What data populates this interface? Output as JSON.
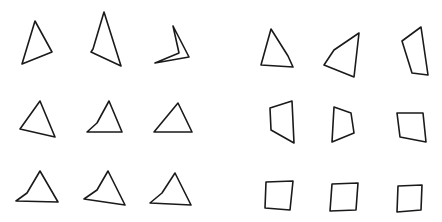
{
  "figure": {
    "stroke_color": "#1a1a1a",
    "background": "#ffffff",
    "panels": [
      {
        "name": "triangles",
        "rows": [
          [
            {
              "points": "35,21 52,52 22,64"
            },
            {
              "points": "104,12 121,66 91,52 93,49"
            },
            {
              "points": "173,26 189,57 155,63 179,53"
            }
          ],
          [
            {
              "points": "40,101 55,137 20,129"
            },
            {
              "points": "109,101 122,132 87,132 97,123"
            },
            {
              "points": "178,103 192,132 154,132"
            }
          ],
          [
            {
              "points": "40,171 58,202 16,201 27,193"
            },
            {
              "points": "108,171 125,205 84,199 97,190"
            },
            {
              "points": "175,173 191,205 150,203 162,193"
            }
          ]
        ]
      },
      {
        "name": "quadrilaterals",
        "rows": [
          [
            {
              "points": "271,29 288,56 293,67 261,65"
            },
            {
              "points": "359,33 354,77 324,65 334,50"
            },
            {
              "points": "421,27 428,75 412,73 402,41"
            }
          ],
          [
            {
              "points": "270,108 292,101 294,143 271,130"
            },
            {
              "points": "334,107 351,113 354,133 332,142"
            },
            {
              "points": "397,113 423,113 426,142 400,137"
            }
          ],
          [
            {
              "points": "266,182 293,181 290,210 265,208"
            },
            {
              "points": "332,184 358,183 356,210 330,211"
            },
            {
              "points": "398,186 422,185 421,210 397,212"
            }
          ]
        ]
      }
    ]
  }
}
